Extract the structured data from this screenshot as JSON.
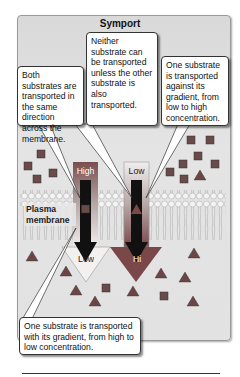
{
  "title": "Symport",
  "callouts": {
    "left_top": "Both substrates are transported in the same direction across the membrane.",
    "center_top": "Neither substrate can be transported unless the other substrate is also transported.",
    "right_top": "One substrate is transported against its gradient, from low to high concentration.",
    "bottom": "One substrate is transported with its gradient, from high to low concentration."
  },
  "membrane_label": "Plasma membrane",
  "gradients": {
    "left": {
      "top_label": "High",
      "bottom_label": "Low"
    },
    "right": {
      "top_label": "Low",
      "bottom_label": "Hi"
    }
  },
  "colors": {
    "square_substrate": "#6b4a4a",
    "triangle_substrate": "#6e4545",
    "high_gradient": "#8a5a5a",
    "panel": "#e0e0e0"
  }
}
